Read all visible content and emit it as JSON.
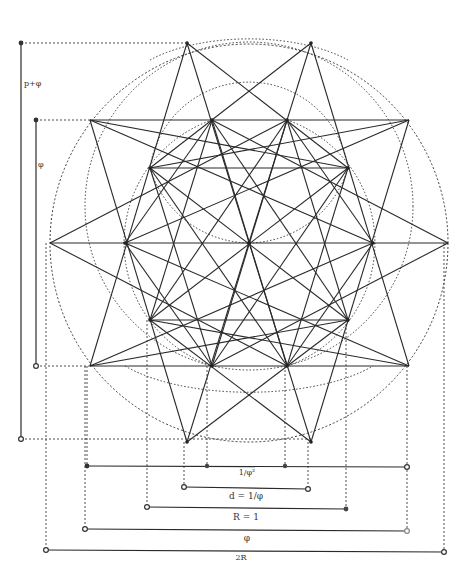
{
  "diagram": {
    "colors": {
      "ink": "#2a2a2a",
      "dotted": "#3a3a3a",
      "background": "#ffffff"
    },
    "center": [
      249,
      243
    ],
    "circles": [
      {
        "name": "outer-circle",
        "cx": 249,
        "cy": 243,
        "r": 199
      },
      {
        "name": "middle-circle",
        "cx": 249,
        "cy": 200,
        "r": 160
      },
      {
        "name": "inner-upper-circle",
        "cx": 249,
        "cy": 145,
        "r": 100
      },
      {
        "name": "inner-lower-circle",
        "cx": 249,
        "cy": 243,
        "r": 125
      }
    ],
    "dimension_labels": {
      "vertical_outer": "p+φ",
      "vertical_inner": "φ",
      "line1": "1/φ²",
      "line2": "d = 1/φ",
      "line3": "R = 1",
      "line4": "φ",
      "line5": "2R"
    },
    "dimension_lines": [
      {
        "name": "line-1-over-phi-squared",
        "x1": 87,
        "x2": 407,
        "y": 466,
        "mid_dots": [
          207,
          285
        ]
      },
      {
        "name": "line-d",
        "x1": 184,
        "x2": 308,
        "y": 489
      },
      {
        "name": "line-R",
        "x1": 147,
        "x2": 346,
        "y": 509
      },
      {
        "name": "line-phi",
        "x1": 85,
        "x2": 407,
        "y": 530
      },
      {
        "name": "line-2R",
        "x1": 46,
        "x2": 444,
        "y": 551
      }
    ],
    "vertical_lines": [
      {
        "name": "vertical-p-plus-phi",
        "x": 21,
        "y1": 43,
        "y2": 439
      },
      {
        "name": "vertical-phi",
        "x": 36,
        "y1": 120,
        "y2": 366
      }
    ]
  }
}
